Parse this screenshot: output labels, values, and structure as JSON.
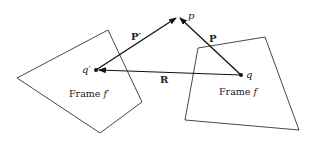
{
  "diagram": {
    "type": "vector-frames",
    "frames": [
      {
        "name": "Frame f'",
        "label": "Frame f′",
        "origin_label": "q′",
        "polygon": [
          [
            17,
            78
          ],
          [
            108,
            30
          ],
          [
            142,
            102
          ],
          [
            100,
            133
          ]
        ],
        "origin": [
          96,
          70
        ],
        "label_pos": [
          70,
          98
        ]
      },
      {
        "name": "Frame f",
        "label": "Frame f",
        "origin_label": "q",
        "polygon": [
          [
            198,
            48
          ],
          [
            265,
            37
          ],
          [
            299,
            130
          ],
          [
            185,
            120
          ]
        ],
        "origin": [
          241,
          75
        ],
        "label_pos": [
          219,
          95
        ]
      }
    ],
    "point": {
      "label": "p",
      "pos": [
        178,
        17
      ]
    },
    "vectors": [
      {
        "label": "P′",
        "from": "q′",
        "to": "p",
        "label_pos": [
          136,
          37
        ]
      },
      {
        "label": "P",
        "from": "q",
        "to": "p",
        "label_pos": [
          208,
          40
        ]
      },
      {
        "label": "R",
        "from": "q",
        "to": "q′",
        "label_pos": [
          163,
          83
        ]
      }
    ]
  },
  "labels": {
    "p": "p",
    "q": "q",
    "q_prime": "q′",
    "P": "P",
    "P_prime": "P′",
    "R": "R",
    "frame_f": "Frame f",
    "frame_f_prime_text": "Frame ",
    "frame_f_prime_var": "f′",
    "frame_f_text": "Frame ",
    "frame_f_var": "f"
  }
}
